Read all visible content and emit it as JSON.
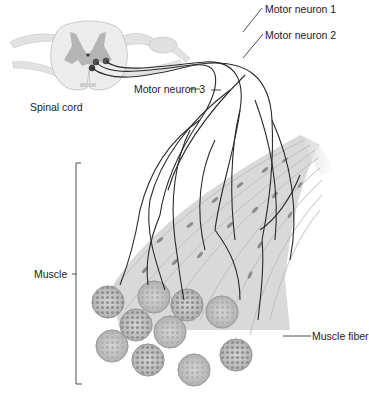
{
  "diagram": {
    "labels": {
      "spinal_cord": "Spinal cord",
      "motor_neuron_1": "Motor neuron 1",
      "motor_neuron_2": "Motor neuron 2",
      "motor_neuron_3": "Motor neuron 3",
      "muscle": "Muscle",
      "muscle_fiber": "Muscle fiber"
    },
    "colors": {
      "background": "#ffffff",
      "neuron_line": "#2a2a2a",
      "tissue_light": "#e6e6e6",
      "tissue_gray": "#bdbdbd",
      "grey_matter": "#a9a9a9",
      "fiber_end": "#c9c9c9",
      "fiber_dots": "#8a8a8a"
    }
  }
}
